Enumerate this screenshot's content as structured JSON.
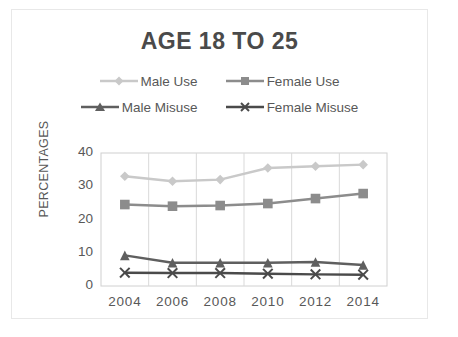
{
  "chart_data": {
    "type": "line",
    "title": "AGE 18 TO 25",
    "xlabel": "",
    "ylabel": "PERCENTAGES",
    "categories": [
      "2004",
      "2006",
      "2008",
      "2010",
      "2012",
      "2014"
    ],
    "yticks": [
      "0",
      "10",
      "20",
      "30",
      "40"
    ],
    "ylim": [
      0,
      40
    ],
    "grid": "vertical",
    "legend_position": "top",
    "series": [
      {
        "name": "Male Use",
        "marker": "diamond",
        "color": "#c9c9c9",
        "values": [
          33,
          31.5,
          32,
          35.5,
          36,
          36.5
        ]
      },
      {
        "name": "Female Use",
        "marker": "square",
        "color": "#8c8c8c",
        "values": [
          24.5,
          24,
          24.2,
          24.8,
          26.3,
          27.8
        ]
      },
      {
        "name": "Male Misuse",
        "marker": "triangle",
        "color": "#5f5f5f",
        "values": [
          9.2,
          7,
          7,
          7,
          7.2,
          6.3
        ]
      },
      {
        "name": "Female Misuse",
        "marker": "x",
        "color": "#4a4a4a",
        "values": [
          4,
          3.9,
          3.9,
          3.7,
          3.5,
          3.4
        ]
      }
    ]
  },
  "legend": {
    "items": [
      {
        "label": "Male Use"
      },
      {
        "label": "Female Use"
      },
      {
        "label": "Male Misuse"
      },
      {
        "label": "Female Misuse"
      }
    ]
  },
  "colors": {
    "title": "#4a4a4a",
    "axis_text": "#585858",
    "frame": "#e8e8e8",
    "grid": "#d9d9d9",
    "plot_border": "#d0d0d0"
  }
}
